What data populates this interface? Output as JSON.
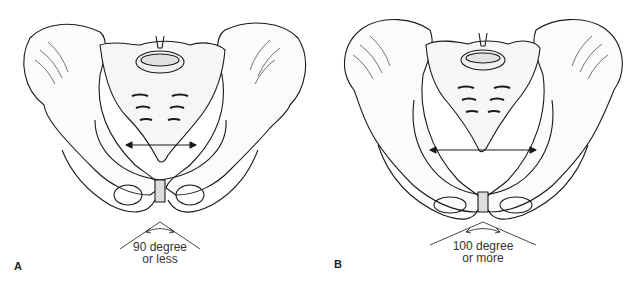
{
  "figure": {
    "panels": [
      {
        "letter": "A",
        "angle_line1": "90 degree",
        "angle_line2": "or less",
        "subpubic_angle": "90 degree or less"
      },
      {
        "letter": "B",
        "angle_line1": "100 degree",
        "angle_line2": "or more",
        "subpubic_angle": "100 degree or more"
      }
    ],
    "colors": {
      "line": "#1a1a1a",
      "background": "#ffffff",
      "text": "#333333"
    }
  }
}
